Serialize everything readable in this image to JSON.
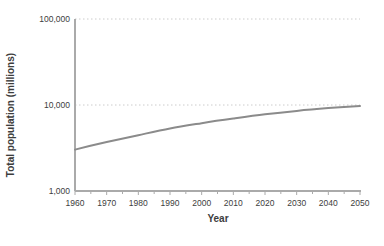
{
  "chart_data": {
    "type": "line",
    "title": "",
    "xlabel": "Year",
    "ylabel": "Total population (millions)",
    "series": [
      {
        "name": "Total population",
        "x": [
          1960,
          1970,
          1980,
          1990,
          2000,
          2010,
          2020,
          2030,
          2040,
          2050
        ],
        "values": [
          3032,
          3700,
          4458,
          5327,
          6143,
          6957,
          7795,
          8549,
          9199,
          9735
        ]
      }
    ],
    "x_ticks_major": [
      1960,
      1970,
      1980,
      1990,
      2000,
      2010,
      2020,
      2030,
      2040,
      2050
    ],
    "x_minor_step": 5,
    "xlim": [
      1960,
      2050
    ],
    "y_scale": "log",
    "ylim": [
      1000,
      100000
    ],
    "y_ticks": [
      {
        "value": 1000,
        "label": "1,000"
      },
      {
        "value": 10000,
        "label": "10,000"
      },
      {
        "value": 100000,
        "label": "100,000"
      }
    ],
    "grid": "horizontal-dotted",
    "legend": "none",
    "colors": {
      "line": "#8b8b8b",
      "axis": "#aaaaaa",
      "grid": "#cccccc",
      "text": "#3d3d3d",
      "background": "#ffffff"
    }
  }
}
